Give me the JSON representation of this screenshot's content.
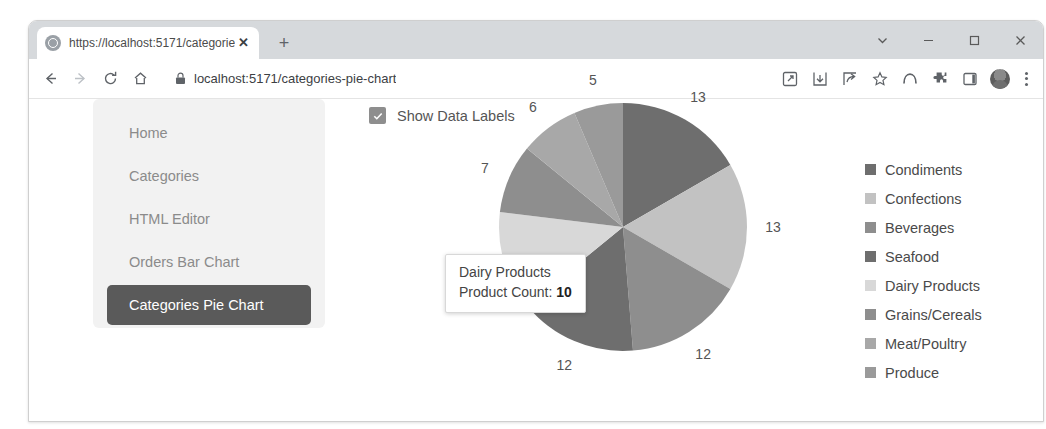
{
  "browser": {
    "tab": {
      "title": "https://localhost:5171/categorie:",
      "favicon": "globe-icon",
      "close_label": "✕"
    },
    "new_tab_label": "+",
    "window_controls": [
      {
        "name": "tab-search",
        "label": "⌄"
      },
      {
        "name": "minimize",
        "label": "–"
      },
      {
        "name": "maximize",
        "label": "□"
      },
      {
        "name": "close",
        "label": "✕"
      }
    ],
    "toolbar": {
      "back_label": "←",
      "forward_label": "→",
      "reload_label": "⟳",
      "home_label": "⌂",
      "url": "localhost:5171/categories-pie-chart",
      "lock_icon": "lock-icon",
      "icons": [
        "split-screen-icon",
        "download-icon",
        "share-icon",
        "bookmark-star-icon",
        "reading-mode-icon",
        "extensions-puzzle-icon",
        "side-panel-icon",
        "profile-avatar-icon",
        "more-menu-icon"
      ]
    }
  },
  "sidebar": {
    "items": [
      {
        "label": "Home",
        "active": false
      },
      {
        "label": "Categories",
        "active": false
      },
      {
        "label": "HTML Editor",
        "active": false
      },
      {
        "label": "Orders Bar Chart",
        "active": false
      },
      {
        "label": "Categories Pie Chart",
        "active": true
      }
    ]
  },
  "controls": {
    "show_data_labels": {
      "label": "Show Data Labels",
      "checked": true
    }
  },
  "tooltip": {
    "title": "Dairy Products",
    "metric_label": "Product Count:",
    "value": "10"
  },
  "colors": {
    "active_nav_bg": "#5a5a5a",
    "sidebar_bg": "#f2f2f2",
    "label_text": "#555555"
  },
  "chart_data": {
    "type": "pie",
    "title": "",
    "value_label": "Product Count",
    "legend_position": "right",
    "show_data_labels": true,
    "total": 78,
    "categories": [
      "Condiments",
      "Confections",
      "Beverages",
      "Seafood",
      "Dairy Products",
      "Grains/Cereals",
      "Meat/Poultry",
      "Produce"
    ],
    "values": [
      13,
      13,
      12,
      12,
      10,
      7,
      6,
      5
    ],
    "slice_colors": [
      "#6e6e6e",
      "#c2c2c2",
      "#8e8e8e",
      "#6e6e6e",
      "#d8d8d8",
      "#8e8e8e",
      "#a8a8a8",
      "#9a9a9a"
    ],
    "labels": [
      "13",
      "13",
      "12",
      "12",
      "10",
      "7",
      "6",
      "5"
    ]
  }
}
